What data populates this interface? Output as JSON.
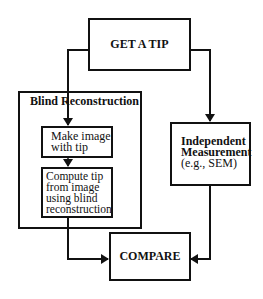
{
  "diagram": {
    "nodes": {
      "get_tip": {
        "label": "GET A TIP"
      },
      "blind_group": {
        "label": "Blind Reconstruction"
      },
      "make_image": {
        "line1": "Make image",
        "line2": "with tip"
      },
      "compute_tip": {
        "line1": "Compute tip",
        "line2": "from image",
        "line3": "using blind",
        "line4": "reconstruction"
      },
      "independent": {
        "line1": "Independent",
        "line2": "Measurement",
        "line3": "(e.g., SEM)"
      },
      "compare": {
        "label": "COMPARE"
      }
    },
    "edges": [
      {
        "from": "GET A TIP",
        "to": "Make image with tip"
      },
      {
        "from": "GET A TIP",
        "to": "Independent Measurement"
      },
      {
        "from": "Make image with tip",
        "to": "Compute tip from image using blind reconstruction"
      },
      {
        "from": "Compute tip from image using blind reconstruction",
        "to": "COMPARE"
      },
      {
        "from": "Independent Measurement",
        "to": "COMPARE"
      }
    ],
    "colors": {
      "line": "#111111",
      "background": "#ffffff"
    }
  }
}
